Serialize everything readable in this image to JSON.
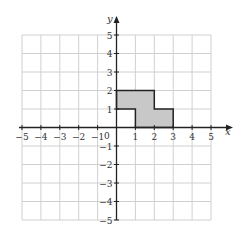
{
  "diagram": {
    "type": "coordinate-grid",
    "x_axis_label": "x",
    "y_axis_label": "y",
    "x_range": [
      -5,
      5
    ],
    "y_range": [
      -5,
      5
    ],
    "x_ticks": [
      "−5",
      "−4",
      "−3",
      "−2",
      "−1",
      "1",
      "2",
      "3",
      "4",
      "5"
    ],
    "y_ticks": [
      "5",
      "4",
      "3",
      "2",
      "1",
      "−1",
      "−2",
      "−3",
      "−4",
      "−5"
    ],
    "origin_label": "0",
    "shaded_polygon": {
      "vertices": [
        [
          0,
          2
        ],
        [
          2,
          2
        ],
        [
          2,
          1
        ],
        [
          3,
          1
        ],
        [
          3,
          0
        ],
        [
          1,
          0
        ],
        [
          1,
          1
        ],
        [
          0,
          1
        ]
      ],
      "fill": "#c8c8c8",
      "stroke": "#222222"
    },
    "grid_color": "#d0d0d0",
    "axis_color": "#222222"
  }
}
